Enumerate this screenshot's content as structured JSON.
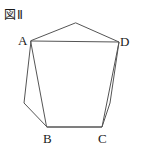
{
  "figure": {
    "caption": "図Ⅱ",
    "canvas": {
      "width": 143,
      "height": 155
    },
    "stroke_color": "#555555",
    "fill_color": "#ffffff",
    "background_color": "#ffffff",
    "text_color": "#1a1a1a",
    "vertex_labels": {
      "a": "A",
      "b": "B",
      "c": "C",
      "d": "D"
    },
    "points": {
      "apex": {
        "x": 76,
        "y": 23
      },
      "a": {
        "x": 31,
        "y": 41
      },
      "left_bulge": {
        "x": 24,
        "y": 103
      },
      "b": {
        "x": 47,
        "y": 127
      },
      "c": {
        "x": 102,
        "y": 127
      },
      "right_bulge": {
        "x": 110,
        "y": 103
      },
      "d": {
        "x": 119,
        "y": 42
      }
    },
    "outer_polygon": "76,23 119,42 110,103 102,127 47,127 24,103 31,41",
    "inner_quadrilateral": "31,41 119,42 102,127 47,127"
  }
}
